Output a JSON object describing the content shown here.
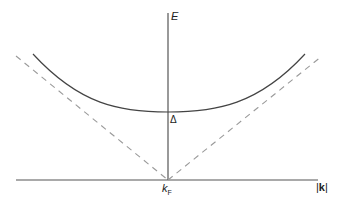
{
  "diagram": {
    "type": "band-dispersion",
    "axes": {
      "vertical_label": "E",
      "horizontal_label_prefix": "|",
      "horizontal_label_main": "k",
      "horizontal_label_suffix": "|"
    },
    "annotations": {
      "gap_label": "Δ",
      "fermi_label_main": "k",
      "fermi_label_sub": "F"
    },
    "curves": [
      {
        "name": "gapped-dispersion",
        "style": "solid",
        "description": "U-shaped curve with minimum Δ at k_F"
      },
      {
        "name": "normal-state-dispersion",
        "style": "dashed",
        "description": "V-shaped lines meeting at k_F on the |k| axis"
      }
    ],
    "colors": {
      "axis": "#555555",
      "curve": "#444444",
      "dashed": "#9a9a9a",
      "text": "#222222"
    }
  }
}
